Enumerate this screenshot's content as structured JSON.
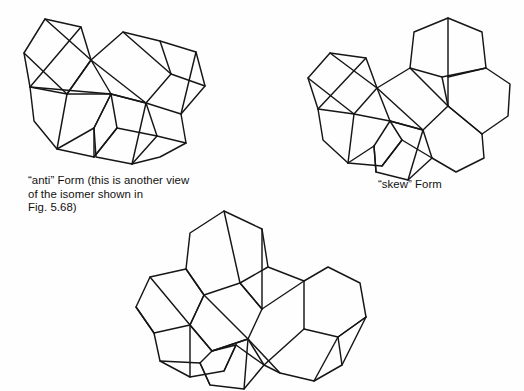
{
  "figure": {
    "kind": "chemical-structure-figure",
    "background_color": "#fefefe",
    "line_color": "#161616",
    "text_color": "#111111"
  },
  "captions": {
    "anti": "“anti” Form  (this is another view\nof the isomer shown in\nFig. 5.68)",
    "skew": "“skew” Form",
    "bottom": ""
  },
  "structures": [
    {
      "id": "anti",
      "name": "anti-form-structure",
      "label": "“anti” Form",
      "viewbox": "0 0 240 185",
      "paths": [
        "M 24,53 L 45,19 L 81,27 L 91,60 L 67,94 L 30,87 Z",
        "M 24,53 L 67,94",
        "M 45,19 L 91,60",
        "M 81,27 L 30,87",
        "M 91,60 L 123,32 L 160,41 L 171,74 L 146,103 L 111,94 Z",
        "M 91,60 L 146,103",
        "M 123,32 L 171,74",
        "M 67,94 L 111,94",
        "M 30,87 L 34,121 L 57,149 L 94,157 L 117,128 L 111,94 Z",
        "M 67,94 L 57,149",
        "M 94,157 L 117,128",
        "M 111,94 L 146,103 L 157,136 L 132,164 L 96,157 L 94,128 Z",
        "M 117,128 L 157,136",
        "M 146,103 L 132,164",
        "M 160,41 L 196,52 L 205,86 L 181,114 L 146,103",
        "M 171,74 L 205,86",
        "M 196,52 L 181,114",
        "M 181,114 L 186,143 L 160,157 L 132,164",
        "M 157,136 L 186,143",
        "M 67,94 L 91,60",
        "M 94,128 L 57,149",
        "M 94,128 L 94,157",
        "M 111,94 L 94,128"
      ]
    },
    {
      "id": "skew",
      "name": "skew-form-structure",
      "label": "“skew” Form",
      "viewbox": "0 0 228 175",
      "paths": [
        "M 12,72 L 34,47 L 70,52 L 81,82 L 58,108 L 22,103 Z",
        "M 12,72 L 58,108",
        "M 34,47 L 81,82",
        "M 70,52 L 22,103",
        "M 81,82 L 114,62 L 146,71 L 152,100 L 127,124 L 94,115 Z",
        "M 81,82 L 127,124",
        "M 114,62 L 152,100",
        "M 58,108 L 94,115",
        "M 22,103 L 27,134 L 52,157 L 86,160 L 106,134 L 94,115",
        "M 58,108 L 52,157",
        "M 86,160 L 106,134",
        "M 94,115 L 127,124 L 136,152 L 112,174 L 80,166 L 78,140",
        "M 106,134 L 136,152",
        "M 127,124 L 112,174",
        "M 114,62 L 118,26 L 152,12 L 186,26 L 190,62 L 152,71",
        "M 146,71 L 190,62",
        "M 152,12 L 152,100",
        "M 190,62 L 214,78 L 212,110 L 186,128 L 152,100",
        "M 152,100 L 186,128",
        "M 186,128 L 188,152 L 160,166 L 136,152",
        "M 78,140 L 52,157",
        "M 78,140 L 80,166",
        "M 94,115 L 78,140"
      ]
    },
    {
      "id": "bottom",
      "name": "bottom-form-structure",
      "label": "",
      "viewbox": "0 0 272 186",
      "paths": [
        "M 22,72 L 58,64 L 76,90 L 62,120 L 26,128 L 8,102 Z",
        "M 22,72 L 62,120",
        "M 58,64 L 76,90",
        "M 8,102 L 26,128",
        "M 76,90 L 112,78 L 134,104 L 120,134 L 84,146 L 62,120 Z",
        "M 76,90 L 120,134",
        "M 112,78 L 134,104",
        "M 62,120 L 84,146",
        "M 26,128 L 32,156 L 62,172 L 96,166 L 108,140 L 84,146",
        "M 62,120 L 62,172",
        "M 96,166 L 108,140",
        "M 84,146 L 120,134 L 136,160 L 116,184 L 82,180 L 72,158",
        "M 108,140 L 136,160",
        "M 120,134 L 116,184",
        "M 58,64 L 62,28 L 96,6 L 134,24 L 140,62 L 112,78",
        "M 96,6 L 112,78",
        "M 134,24 L 134,104",
        "M 140,62 L 176,76 L 200,62 L 232,78 L 238,112 L 210,132",
        "M 134,104 L 176,76",
        "M 176,76 L 176,124",
        "M 210,132 L 238,112",
        "M 176,124 L 210,132 L 214,160 L 186,176 L 152,168 L 136,160",
        "M 120,134 L 152,168",
        "M 176,124 L 136,160",
        "M 210,132 L 186,176",
        "M 72,158 L 32,156",
        "M 72,158 L 82,180",
        "M 84,146 L 72,158",
        "M 238,112 L 214,160"
      ]
    }
  ]
}
